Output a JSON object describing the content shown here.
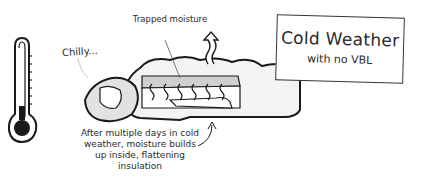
{
  "title_box": {
    "title": "Cold Weather",
    "subtitle": "with no VBL"
  },
  "labels": {
    "trapped": "Trapped moisture",
    "chilly": "Chilly...",
    "caption": "After multiple days in cold weather, moisture builds up inside, flattening insulation"
  },
  "icons": [
    "thermometer-icon",
    "sleeping-bag-illustration",
    "vapor-arrow-icon",
    "pointer-arrow-icon"
  ],
  "colors": {
    "ink": "#1a1a1a",
    "shade": "#d8d8d8",
    "background": "#ffffff"
  }
}
